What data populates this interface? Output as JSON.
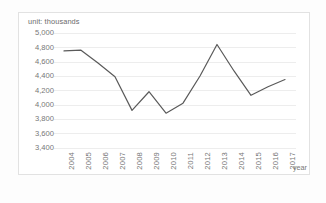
{
  "figure": {
    "unit_label": "unit: thousands",
    "caption": "",
    "background_color": "#ffffff",
    "frame_color": "#e2e2e2"
  },
  "chart_data": {
    "type": "line",
    "title": "",
    "subtitle": "",
    "unit_note": "unit: thousands",
    "xlabel": "year",
    "ylabel": "",
    "categories": [
      "2004",
      "2005",
      "2006",
      "2007",
      "2008",
      "2009",
      "2010",
      "2011",
      "2012",
      "2013",
      "2014",
      "2015",
      "2016",
      "2017"
    ],
    "values": [
      4750,
      4760,
      4580,
      4390,
      3920,
      4180,
      3880,
      4020,
      4400,
      4840,
      4470,
      4130,
      4250,
      4350
    ],
    "series": [
      {
        "name": "",
        "values": [
          4750,
          4760,
          4580,
          4390,
          3920,
          4180,
          3880,
          4020,
          4400,
          4840,
          4470,
          4130,
          4250,
          4350
        ],
        "color": "#5a5a5a"
      }
    ],
    "ylim": [
      3400,
      5000
    ],
    "ytick_step": 200,
    "yticks": [
      5000,
      4800,
      4600,
      4400,
      4200,
      4000,
      3800,
      3600,
      3400
    ],
    "ytick_labels": [
      "5,000",
      "4,800",
      "4,600",
      "4,400",
      "4,200",
      "4,000",
      "3,800",
      "3,600",
      "3,400"
    ],
    "xtick_labels": [
      "2004",
      "2005",
      "2006",
      "2007",
      "2008",
      "2009",
      "2010",
      "2011",
      "2012",
      "2013",
      "2014",
      "2015",
      "2016",
      "2017"
    ],
    "xtick_rotation": -90,
    "grid": true,
    "grid_axis": "y",
    "grid_color": "#ededed",
    "legend": false,
    "legend_position": "none",
    "markers": false,
    "line_color": "#5a5a5a",
    "line_width": 1.2
  }
}
